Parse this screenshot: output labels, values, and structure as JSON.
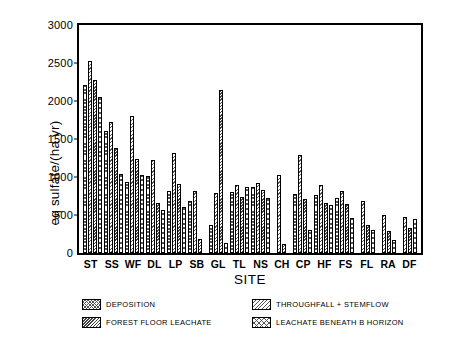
{
  "chart_data": {
    "type": "bar",
    "title": "",
    "xlabel": "SITE",
    "ylabel": "eq sulfate/(ha yr)",
    "ylim": [
      0,
      3000
    ],
    "yticks": [
      0,
      500,
      1000,
      1500,
      2000,
      2500,
      3000
    ],
    "grid": false,
    "legend_position": "below-axes",
    "categories": [
      "ST",
      "SS",
      "WF",
      "DL",
      "LP",
      "SB",
      "GL",
      "TL",
      "NS",
      "CH",
      "CP",
      "HF",
      "FS",
      "FL",
      "RA",
      "DF"
    ],
    "series": [
      {
        "name": "DEPOSITION",
        "pattern": "crosshatch-fine",
        "values": [
          2210,
          1600,
          940,
          1010,
          810,
          690,
          370,
          800,
          870,
          0,
          780,
          760,
          730,
          0,
          0,
          0
        ]
      },
      {
        "name": "THROUGHFALL + STEMFLOW",
        "pattern": "diagonal-left",
        "values": [
          2520,
          1730,
          1800,
          1230,
          1320,
          810,
          790,
          890,
          920,
          1020,
          1290,
          900,
          820,
          690,
          500,
          470
        ]
      },
      {
        "name": "FOREST FLOOR LEACHATE",
        "pattern": "diagonal-dense",
        "values": [
          2280,
          1380,
          1240,
          660,
          910,
          180,
          2140,
          740,
          830,
          120,
          710,
          660,
          640,
          370,
          290,
          330
        ]
      },
      {
        "name": "LEACHATE BENEATH B HORIZON",
        "pattern": "crosshatch-open",
        "values": [
          2050,
          1040,
          1030,
          570,
          610,
          0,
          130,
          870,
          720,
          0,
          300,
          630,
          460,
          300,
          170,
          450
        ]
      }
    ]
  },
  "legend": {
    "items": [
      {
        "label": "DEPOSITION",
        "pattern": "crosshatch-fine"
      },
      {
        "label": "THROUGHFALL + STEMFLOW",
        "pattern": "diagonal-left"
      },
      {
        "label": "FOREST FLOOR LEACHATE",
        "pattern": "diagonal-dense"
      },
      {
        "label": "LEACHATE BENEATH B HORIZON",
        "pattern": "crosshatch-open"
      }
    ]
  },
  "colors": {
    "axis": "#000000",
    "background": "#ffffff",
    "hatch": "#555555"
  }
}
